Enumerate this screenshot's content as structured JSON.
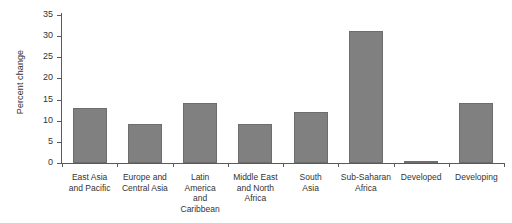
{
  "chart_data": {
    "type": "bar",
    "title": "",
    "xlabel": "",
    "ylabel": "Percent change",
    "ylim": [
      0,
      35
    ],
    "yticks": [
      0,
      5,
      10,
      15,
      20,
      25,
      30,
      35
    ],
    "grid": false,
    "legend": null,
    "bar_color": "#808080",
    "bar_edge_color": "#6d6d6d",
    "axis_color": "#5a5a5a",
    "categories": [
      "East Asia\nand Pacific",
      "Europe and\nCentral Asia",
      "Latin\nAmerica\nand\nCaribbean",
      "Middle East\nand North\nAfrica",
      "South\nAsia",
      "Sub-Saharan\nAfrica",
      "Developed",
      "Developing"
    ],
    "values": [
      13.1,
      9.2,
      14.2,
      9.2,
      12.0,
      31.3,
      0.3,
      14.2
    ]
  }
}
